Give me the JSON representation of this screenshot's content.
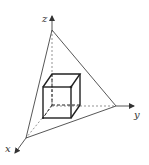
{
  "diagram": {
    "axes": {
      "x": {
        "label": "x"
      },
      "y": {
        "label": "y"
      },
      "z": {
        "label": "z"
      }
    },
    "colors": {
      "line": "#444444",
      "cube": "#222222",
      "background": "#ffffff"
    }
  }
}
